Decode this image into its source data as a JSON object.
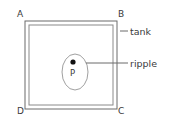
{
  "diagram": {
    "type": "physics-schematic",
    "background_color": "#ffffff",
    "line_color": "#6b6b6b",
    "text_color": "#3a3a3a",
    "marker_color": "#111111",
    "corner_labels": [
      {
        "id": "A",
        "text": "A",
        "position": "top-left"
      },
      {
        "id": "B",
        "text": "B",
        "position": "top-right"
      },
      {
        "id": "C",
        "text": "C",
        "position": "bottom-right"
      },
      {
        "id": "D",
        "text": "D",
        "position": "bottom-left"
      }
    ],
    "callouts": [
      {
        "id": "tank",
        "text": "tank",
        "points_to": "tank-wall"
      },
      {
        "id": "ripple",
        "text": "ripple",
        "points_to": "ripple-ellipse"
      }
    ],
    "point_source": {
      "label": "P",
      "marker": "filled-dot"
    },
    "tank": {
      "outer": {
        "x": 25,
        "y": 21,
        "width": 92,
        "height": 88
      },
      "inner": {
        "x": 29,
        "y": 25,
        "width": 84,
        "height": 80
      }
    },
    "ripple": {
      "shape": "ellipse",
      "cx": 75,
      "cy": 72,
      "rx": 13,
      "ry": 18
    },
    "marker_dot": {
      "cx": 73,
      "cy": 62,
      "r": 2.6
    },
    "leader_lines": [
      {
        "id": "tank-leader",
        "x1": 120,
        "y1": 31,
        "x2": 128,
        "y2": 31
      },
      {
        "id": "ripple-leader",
        "x1": 86,
        "y1": 63,
        "x2": 128,
        "y2": 63
      }
    ]
  }
}
